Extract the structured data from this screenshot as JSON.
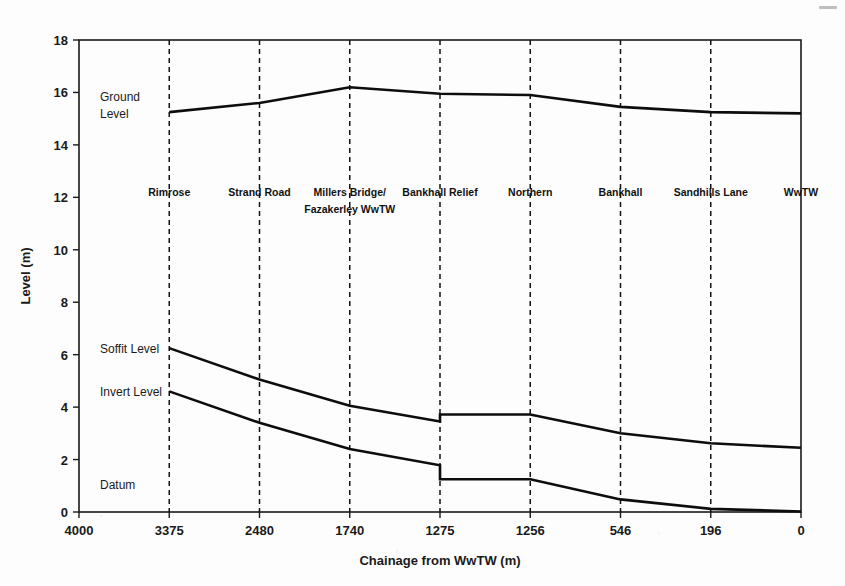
{
  "chart_data": {
    "type": "line",
    "title": "",
    "subtitle": "",
    "xlabel": "Chainage from WwTW (m)",
    "ylabel": "Level (m)",
    "x": [
      4000,
      3375,
      2480,
      1740,
      1275,
      1256,
      546,
      196,
      0
    ],
    "x_tick_labels": [
      "4000",
      "3375",
      "2480",
      "1740",
      "1275",
      "1256",
      "546",
      "196",
      "0"
    ],
    "x_axis_type": "categorical-evenly-spaced",
    "xlim": [
      0,
      8
    ],
    "y_tick_labels": [
      "0",
      "2",
      "4",
      "6",
      "8",
      "10",
      "12",
      "14",
      "16",
      "18"
    ],
    "y_ticks": [
      0,
      2,
      4,
      6,
      8,
      10,
      12,
      14,
      16,
      18
    ],
    "ylim": [
      0,
      18
    ],
    "grid": "vertical dashed gridlines at each chainage station",
    "legend": "inline labels at left of each series",
    "series": [
      {
        "name": "Ground Level",
        "label_text": "Ground\nLevel",
        "label_line1": "Ground",
        "label_line2": "Level",
        "x_index_start": 1,
        "points": [
          {
            "x": 3375,
            "y": 15.25
          },
          {
            "x": 2480,
            "y": 15.6
          },
          {
            "x": 1740,
            "y": 16.2
          },
          {
            "x": 1275,
            "y": 15.95
          },
          {
            "x": 1256,
            "y": 15.9
          },
          {
            "x": 546,
            "y": 15.45
          },
          {
            "x": 196,
            "y": 15.25
          },
          {
            "x": 0,
            "y": 15.2
          }
        ]
      },
      {
        "name": "Soffit Level",
        "label_text": "Soffit Level",
        "x_index_start": 1,
        "has_step": true,
        "step_at_chainage": 1275,
        "points": [
          {
            "x": 3375,
            "y": 6.25
          },
          {
            "x": 2480,
            "y": 5.05
          },
          {
            "x": 1740,
            "y": 4.05
          },
          {
            "x": 1275,
            "y": 3.45
          },
          {
            "x": 1275,
            "y": 3.72
          },
          {
            "x": 1256,
            "y": 3.72
          },
          {
            "x": 546,
            "y": 3.0
          },
          {
            "x": 196,
            "y": 2.62
          },
          {
            "x": 0,
            "y": 2.45
          }
        ]
      },
      {
        "name": "Invert Level",
        "label_text": "Invert Level",
        "x_index_start": 1,
        "has_step": true,
        "step_at_chainage": 1275,
        "points": [
          {
            "x": 3375,
            "y": 4.6
          },
          {
            "x": 2480,
            "y": 3.4
          },
          {
            "x": 1740,
            "y": 2.4
          },
          {
            "x": 1275,
            "y": 1.78
          },
          {
            "x": 1275,
            "y": 1.25
          },
          {
            "x": 1256,
            "y": 1.25
          },
          {
            "x": 546,
            "y": 0.48
          },
          {
            "x": 196,
            "y": 0.12
          },
          {
            "x": 0,
            "y": 0.02
          }
        ]
      }
    ],
    "annotations": [
      {
        "name": "datum",
        "text": "Datum",
        "x": 4000,
        "y": 0.9
      }
    ],
    "stations": [
      {
        "label": "Rimrose",
        "chainage": "3375",
        "lines": [
          "Rimrose"
        ]
      },
      {
        "label": "Strand Road",
        "chainage": "2480",
        "lines": [
          "Strand Road"
        ]
      },
      {
        "label": "Millers Bridge/ Fazakerley WwTW",
        "chainage": "1740",
        "lines": [
          "Millers Bridge/",
          "Fazakerley WwTW"
        ]
      },
      {
        "label": "Bankhall Relief",
        "chainage": "1275",
        "lines": [
          "Bankhall Relief"
        ]
      },
      {
        "label": "Northern",
        "chainage": "1256",
        "lines": [
          "Northern"
        ]
      },
      {
        "label": "Bankhall",
        "chainage": "546",
        "lines": [
          "Bankhall"
        ]
      },
      {
        "label": "Sandhills Lane",
        "chainage": "196",
        "lines": [
          "Sandhills Lane"
        ]
      },
      {
        "label": "WwTW",
        "chainage": "0",
        "lines": [
          "WwTW"
        ]
      }
    ],
    "colors": {
      "line": "#0d0d0d",
      "axis": "#1a1a1a",
      "grid": "#111111",
      "background": "#fdfdfd"
    }
  }
}
